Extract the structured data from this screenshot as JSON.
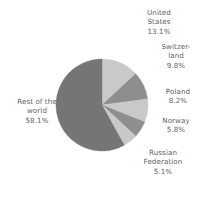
{
  "chart_data": {
    "type": "pie",
    "title": "",
    "subtitle": "",
    "xlabel": "",
    "ylabel": "",
    "legend_position": "none",
    "grid": false,
    "units": "percent",
    "start_angle_deg": 0,
    "direction": "clockwise",
    "categories": [
      "United States",
      "Switzerland",
      "Poland",
      "Norway",
      "Russian Federation",
      "Rest of the world"
    ],
    "values": [
      13.1,
      9.8,
      8.2,
      5.8,
      5.1,
      58.1
    ],
    "slices": [
      {
        "name": "United States",
        "value": 13.1,
        "value_label": "13.1%",
        "color": "#c9c9c9",
        "label_lines": [
          "United",
          "States",
          "13.1%"
        ]
      },
      {
        "name": "Switzerland",
        "value": 9.8,
        "value_label": "9.8%",
        "color": "#8e8e8e",
        "label_lines": [
          "Switzer-",
          "land",
          "9.8%"
        ]
      },
      {
        "name": "Poland",
        "value": 8.2,
        "value_label": "8.2%",
        "color": "#c9c9c9",
        "label_lines": [
          "Poland",
          "8.2%"
        ]
      },
      {
        "name": "Norway",
        "value": 5.8,
        "value_label": "5.8%",
        "color": "#8e8e8e",
        "label_lines": [
          "Norway",
          "5.8%"
        ]
      },
      {
        "name": "Russian Federation",
        "value": 5.1,
        "value_label": "5.1%",
        "color": "#c9c9c9",
        "label_lines": [
          "Russian",
          "Federation",
          "5.1%"
        ]
      },
      {
        "name": "Rest of the world",
        "value": 58.1,
        "value_label": "58.1%",
        "color": "#757575",
        "label_lines": [
          "Rest of the",
          "world",
          "58.1%"
        ]
      }
    ],
    "geometry": {
      "center_x": 102,
      "center_y": 105,
      "radius": 46
    },
    "colors": {
      "background": "#ffffff",
      "label_text": "#606060",
      "slice_light": "#c9c9c9",
      "slice_medium": "#8e8e8e",
      "slice_dark": "#757575"
    }
  }
}
